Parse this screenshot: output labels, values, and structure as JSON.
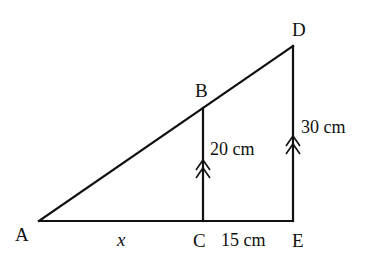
{
  "figure": {
    "type": "similar-triangles",
    "points": {
      "A": {
        "label": "A",
        "x": 39,
        "y": 221
      },
      "B": {
        "label": "B",
        "x": 203,
        "y": 108
      },
      "C": {
        "label": "C",
        "x": 203,
        "y": 221
      },
      "D": {
        "label": "D",
        "x": 293,
        "y": 46
      },
      "E": {
        "label": "E",
        "x": 293,
        "y": 221
      }
    },
    "segments": [
      {
        "name": "AE",
        "from": "A",
        "to": "E"
      },
      {
        "name": "AD",
        "from": "A",
        "to": "D"
      },
      {
        "name": "BC",
        "from": "B",
        "to": "C"
      },
      {
        "name": "DE",
        "from": "D",
        "to": "E"
      }
    ],
    "labels": {
      "A": "A",
      "B": "B",
      "C": "C",
      "D": "D",
      "E": "E",
      "AC": "x",
      "CE": "15 cm",
      "BC": "20 cm",
      "DE": "30 cm"
    },
    "parallel_marks": {
      "BC": {
        "style": "double-arrow",
        "x": 203,
        "tip_y": 160
      },
      "DE": {
        "style": "double-arrow",
        "x": 293,
        "tip_y": 136
      }
    },
    "line_color": "#111111",
    "background": "#ffffff"
  }
}
